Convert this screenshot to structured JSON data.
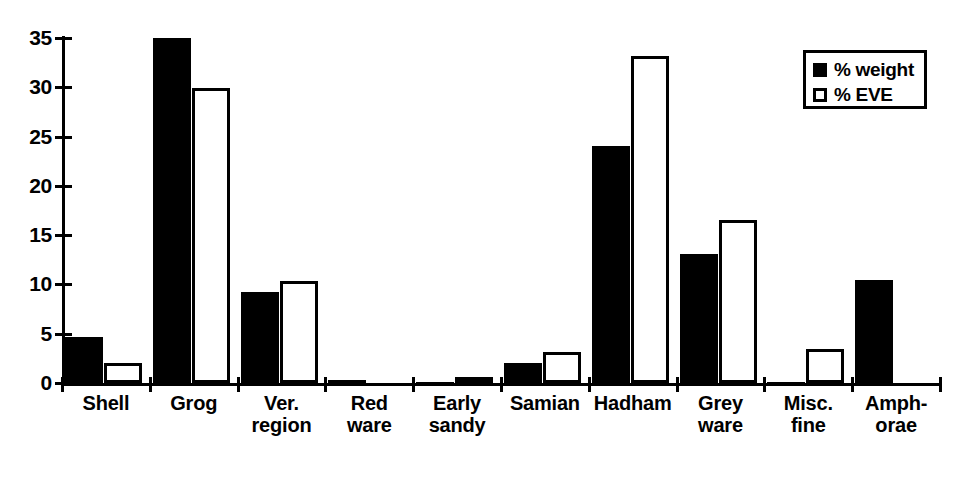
{
  "chart_data": {
    "type": "bar",
    "title": "",
    "subtitle": "",
    "xlabel": "",
    "ylabel": "",
    "ylim": [
      0,
      35
    ],
    "yticks": [
      0,
      5,
      10,
      15,
      20,
      25,
      30,
      35
    ],
    "ytick_labels": [
      "0",
      "5",
      "10",
      "15",
      "20",
      "25",
      "30",
      "35"
    ],
    "grid": false,
    "legend_position": "top-right",
    "categories": [
      "Shell",
      "Grog",
      "Ver. region",
      "Red ware",
      "Early sandy",
      "Samian",
      "Hadham",
      "Grey ware",
      "Misc. fine",
      "Amph-orae"
    ],
    "category_lines": [
      [
        "Shell",
        ""
      ],
      [
        "Grog",
        ""
      ],
      [
        "Ver.",
        "region"
      ],
      [
        "Red",
        "ware"
      ],
      [
        "Early",
        "sandy"
      ],
      [
        "Samian",
        ""
      ],
      [
        "Hadham",
        ""
      ],
      [
        "Grey",
        "ware"
      ],
      [
        "Misc.",
        "fine"
      ],
      [
        "Amph-",
        "orae"
      ]
    ],
    "series": [
      {
        "name": "% weight",
        "color": "#000000",
        "style": "filled",
        "values": [
          4.7,
          35.0,
          9.2,
          0.35,
          0.15,
          2.0,
          24.0,
          13.1,
          0.1,
          10.5
        ]
      },
      {
        "name": "% EVE",
        "color": "#ffffff",
        "style": "hollow",
        "values": [
          2.0,
          29.9,
          10.4,
          0.0,
          0.3,
          3.1,
          33.2,
          16.5,
          3.5,
          0.0
        ]
      }
    ]
  },
  "legend": {
    "items": [
      {
        "label": "% weight",
        "swatch": "filled-square"
      },
      {
        "label": "% EVE",
        "swatch": "hollow-square"
      }
    ]
  }
}
